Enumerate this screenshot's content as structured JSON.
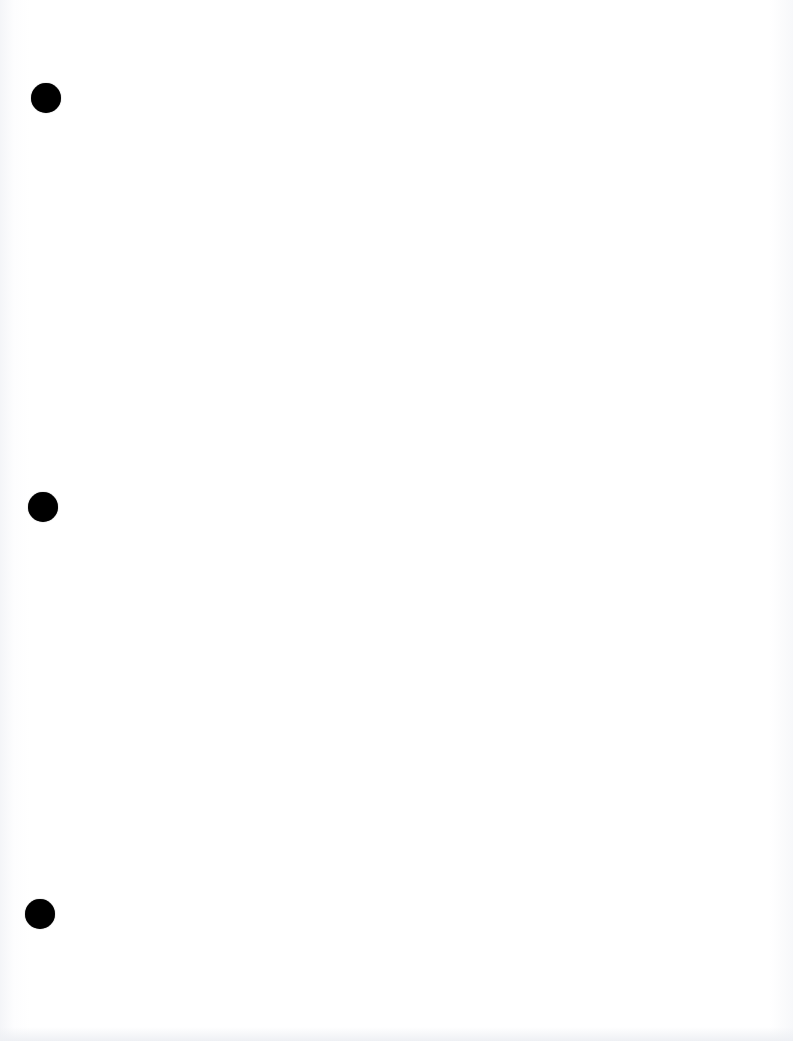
{
  "document": {
    "type": "blank scanned page",
    "background_color": "#ffffff",
    "text_content": "",
    "punch_holes": [
      {
        "id": "top",
        "cx": 46,
        "cy": 98,
        "diameter": 30,
        "color": "#000000"
      },
      {
        "id": "middle",
        "cx": 43,
        "cy": 507,
        "diameter": 30,
        "color": "#000000"
      },
      {
        "id": "bottom",
        "cx": 40,
        "cy": 914,
        "diameter": 30,
        "color": "#000000"
      }
    ]
  }
}
